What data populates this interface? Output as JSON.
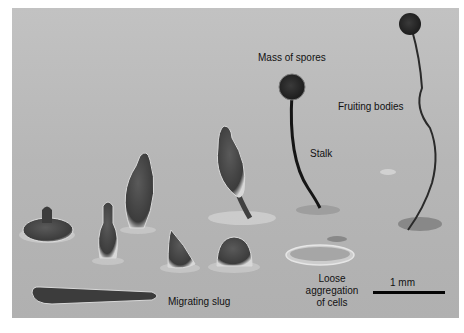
{
  "figure": {
    "labels": {
      "mass_of_spores": "Mass of spores",
      "fruiting_bodies": "Fruiting bodies",
      "stalk": "Stalk",
      "loose_aggregation": [
        "Loose",
        "aggregation",
        "of cells"
      ],
      "migrating_slug": "Migrating slug"
    },
    "scale_bar": {
      "label": "1 mm"
    },
    "colors": {
      "background_gray": "#b9b9b9",
      "structure_dark": "#3a3a3a",
      "label_text": "#111111"
    }
  }
}
